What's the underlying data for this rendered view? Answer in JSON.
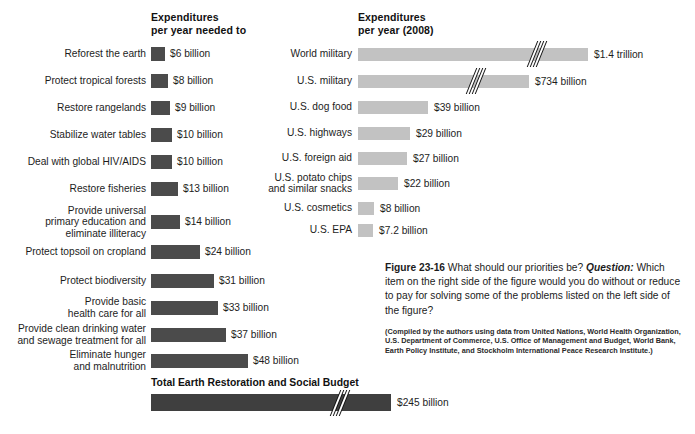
{
  "chart_data": {
    "type": "bar",
    "title": "Figure 23-16 What should our priorities be?",
    "orientation": "horizontal",
    "panels": [
      {
        "name": "left",
        "header": "Expenditures\nper year needed to",
        "unit": "billion US$ per year",
        "bar_color": "#4b4b4b",
        "categories": [
          "Reforest the earth",
          "Protect tropical forests",
          "Restore rangelands",
          "Stabilize water tables",
          "Deal with global HIV/AIDS",
          "Restore fisheries",
          "Provide universal\nprimary education and\neliminate illiteracy",
          "Protect topsoil on cropland",
          "Protect biodiversity",
          "Provide basic\nhealth care for all",
          "Provide clean drinking water\nand sewage treatment for all",
          "Eliminate hunger\nand malnutrition"
        ],
        "values": [
          6,
          8,
          9,
          10,
          10,
          13,
          14,
          24,
          31,
          33,
          37,
          48
        ],
        "value_labels": [
          "$6 billion",
          "$8 billion",
          "$9 billion",
          "$10 billion",
          "$10 billion",
          "$13 billion",
          "$14 billion",
          "$24 billion",
          "$31 billion",
          "$33 billion",
          "$37 billion",
          "$48 billion"
        ],
        "total": {
          "label": "Total Earth Restoration and Social Budget",
          "value": 245,
          "value_label": "$245 billion",
          "axis_break": true
        }
      },
      {
        "name": "right",
        "header": "Expenditures\nper year (2008)",
        "unit": "billion US$ per year",
        "bar_color": "#c2c2c2",
        "categories": [
          "World military",
          "U.S. military",
          "U.S. dog food",
          "U.S. highways",
          "U.S. foreign aid",
          "U.S. potato chips\nand similar snacks",
          "U.S. cosmetics",
          "U.S. EPA"
        ],
        "values": [
          1400,
          734,
          39,
          29,
          27,
          22,
          8,
          7.2
        ],
        "value_labels": [
          "$1.4 trillion",
          "$734 billion",
          "$39 billion",
          "$29 billion",
          "$27 billion",
          "$22 billion",
          "$8 billion",
          "$7.2 billion"
        ],
        "axis_breaks": [
          "World military",
          "U.S. military"
        ]
      }
    ]
  },
  "left": {
    "header": "Expenditures\nper year needed to",
    "rows": [
      {
        "label": "Reforest the earth",
        "value_label": "$6 billion",
        "bar_px": 14,
        "top": 46
      },
      {
        "label": "Protect tropical forests",
        "value_label": "$8 billion",
        "bar_px": 17,
        "top": 73
      },
      {
        "label": "Restore rangelands",
        "value_label": "$9 billion",
        "bar_px": 19,
        "top": 100
      },
      {
        "label": "Stabilize water tables",
        "value_label": "$10 billion",
        "bar_px": 21,
        "top": 127
      },
      {
        "label": "Deal with global HIV/AIDS",
        "value_label": "$10 billion",
        "bar_px": 21,
        "top": 154
      },
      {
        "label": "Restore fisheries",
        "value_label": "$13 billion",
        "bar_px": 27,
        "top": 181
      },
      {
        "label": "Provide universal\nprimary education and\neliminate illiteracy",
        "value_label": "$14 billion",
        "bar_px": 29,
        "top": 214
      },
      {
        "label": "Protect topsoil on cropland",
        "value_label": "$24 billion",
        "bar_px": 49,
        "top": 244
      },
      {
        "label": "Protect biodiversity",
        "value_label": "$31 billion",
        "bar_px": 63,
        "top": 273
      },
      {
        "label": "Provide basic\nhealth care for all",
        "value_label": "$33 billion",
        "bar_px": 67,
        "top": 300
      },
      {
        "label": "Provide clean drinking water\nand sewage treatment for all",
        "value_label": "$37 billion",
        "bar_px": 75,
        "top": 327
      },
      {
        "label": "Eliminate hunger\nand malnutrition",
        "value_label": "$48 billion",
        "bar_px": 97,
        "top": 353
      }
    ],
    "total_label": "Total Earth Restoration and Social Budget",
    "total_value_label": "$245 billion",
    "total_bar_px": 240
  },
  "right": {
    "header": "Expenditures\nper year (2008)",
    "rows": [
      {
        "label": "World military",
        "value_label": "$1.4 trillion",
        "bar_px": 230,
        "top": 47,
        "break_px": 172
      },
      {
        "label": "U.S. military",
        "value_label": "$734 billion",
        "bar_px": 171,
        "top": 74,
        "break_px": 111
      },
      {
        "label": "U.S. dog food",
        "value_label": "$39 billion",
        "bar_px": 70,
        "top": 100,
        "break_px": null
      },
      {
        "label": "U.S. highways",
        "value_label": "$29 billion",
        "bar_px": 52,
        "top": 126,
        "break_px": null
      },
      {
        "label": "U.S. foreign aid",
        "value_label": "$27 billion",
        "bar_px": 49,
        "top": 151,
        "break_px": null
      },
      {
        "label": "U.S. potato chips\nand similar snacks",
        "value_label": "$22 billion",
        "bar_px": 40,
        "top": 176,
        "break_px": null
      },
      {
        "label": "U.S. cosmetics",
        "value_label": "$8 billion",
        "bar_px": 16,
        "top": 201,
        "break_px": null
      },
      {
        "label": "U.S. EPA",
        "value_label": "$7.2 billion",
        "bar_px": 15,
        "top": 223,
        "break_px": null
      }
    ]
  },
  "caption": {
    "figure_number": "Figure 23-16",
    "title_text": " What should our priorities be? ",
    "question_label": "Question:",
    "question_text": " Which item on the right side of the figure would you do without or reduce to pay for solving some of the problems listed on the left side of the figure?",
    "source": "(Compiled by the authors using data from United Nations, World Health Organization, U.S. Department of Commerce, U.S. Office of Management and Budget, World Bank, Earth Policy Institute, and Stockholm International Peace Research Institute.)"
  },
  "colors": {
    "left_bar": "#4b4b4b",
    "right_bar": "#c2c2c2",
    "total_bar": "#3f3f3f",
    "text": "#1b1b1b",
    "background": "#ffffff"
  }
}
